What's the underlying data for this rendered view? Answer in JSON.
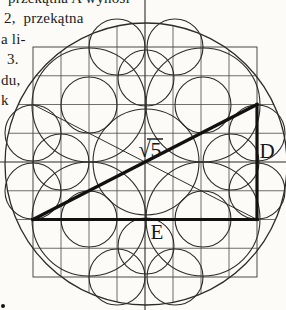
{
  "page": {
    "background": "#fcfbf7",
    "ink": "#2e2c2a",
    "grid_color": "#4c4a46",
    "thick_color": "#121110",
    "text_color": "#1b1b1b"
  },
  "text_column": {
    "lines": [
      {
        "text": "przekątna A wynosi"
      },
      {
        "text": "2,  przekątna"
      },
      {
        "text": "a li-"
      },
      {
        "text": "3."
      },
      {
        "text": "du,"
      },
      {
        "text": "k"
      }
    ]
  },
  "figure": {
    "labels": {
      "hypotenuse": "√5",
      "right_side": "D",
      "bottom_side": "E"
    },
    "geometry": {
      "outer_circle": {
        "cx": 146,
        "cy": 164,
        "r": 141
      },
      "grid": {
        "x0": 33,
        "y0": 47,
        "dx": 28,
        "dy": 28.75,
        "nx": 8,
        "ny": 8
      },
      "center_vertical_x": 145,
      "center_horizontal_y": 162,
      "circles": [
        {
          "cx": 146,
          "cy": 162,
          "r": 53
        },
        {
          "cx": 89,
          "cy": 105,
          "r": 57
        },
        {
          "cx": 203,
          "cy": 105,
          "r": 57
        },
        {
          "cx": 89,
          "cy": 219,
          "r": 57
        },
        {
          "cx": 203,
          "cy": 219,
          "r": 57
        },
        {
          "cx": 89,
          "cy": 105,
          "r": 28
        },
        {
          "cx": 203,
          "cy": 105,
          "r": 28
        },
        {
          "cx": 89,
          "cy": 219,
          "r": 28
        },
        {
          "cx": 203,
          "cy": 219,
          "r": 28
        },
        {
          "cx": 61,
          "cy": 162,
          "r": 28
        },
        {
          "cx": 231,
          "cy": 162,
          "r": 28
        },
        {
          "cx": 146,
          "cy": 78,
          "r": 28
        },
        {
          "cx": 146,
          "cy": 246,
          "r": 28
        },
        {
          "cx": 117,
          "cy": 47,
          "r": 28
        },
        {
          "cx": 175,
          "cy": 47,
          "r": 28
        },
        {
          "cx": 117,
          "cy": 277,
          "r": 28
        },
        {
          "cx": 175,
          "cy": 277,
          "r": 28
        },
        {
          "cx": 33,
          "cy": 133,
          "r": 28
        },
        {
          "cx": 33,
          "cy": 191,
          "r": 28
        },
        {
          "cx": 257,
          "cy": 133,
          "r": 28
        },
        {
          "cx": 257,
          "cy": 191,
          "r": 28
        }
      ],
      "thin_diagonal": {
        "x1": 33,
        "y1": 104.5,
        "x2": 257,
        "y2": 219.5
      },
      "triangle_thick": [
        {
          "x1": 33,
          "y1": 219.5,
          "x2": 257,
          "y2": 219.5
        },
        {
          "x1": 257,
          "y1": 104.5,
          "x2": 257,
          "y2": 219.5
        },
        {
          "x1": 33,
          "y1": 219.5,
          "x2": 257,
          "y2": 104.5
        }
      ],
      "vinculum": {
        "x1": 147,
        "y1": 139,
        "x2": 163,
        "y2": 139
      },
      "speck": {
        "cx": 3,
        "cy": 306,
        "r": 2
      }
    }
  }
}
